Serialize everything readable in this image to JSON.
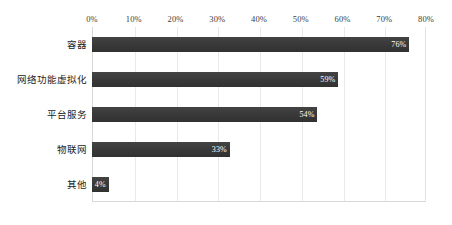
{
  "chart_data": {
    "type": "bar",
    "orientation": "horizontal",
    "title": "",
    "subtitle": "",
    "xlabel": "",
    "ylabel": "",
    "xlim": [
      0,
      80
    ],
    "grid": true,
    "legend": false,
    "legend_position": "none",
    "value_suffix": "%",
    "categories": [
      "容器",
      "网络功能虚拟化",
      "平台服务",
      "物联网",
      "其他"
    ],
    "values": [
      76,
      59,
      54,
      33,
      4
    ],
    "value_labels": [
      "76%",
      "59%",
      "54%",
      "33%",
      "4%"
    ],
    "xticks": [
      0,
      10,
      20,
      30,
      40,
      50,
      60,
      70,
      80
    ],
    "xtick_labels": [
      "0%",
      "10%",
      "20%",
      "30%",
      "40%",
      "50%",
      "60%",
      "70%",
      "80%"
    ],
    "series": [
      {
        "name": "",
        "values": [
          76,
          59,
          54,
          33,
          4
        ]
      }
    ]
  },
  "style": {
    "bar_color": "#3a3a3a",
    "value_text_color": "#ffffff",
    "gridline_color": "#e9e9e9",
    "axis_color": "#d6d6d6",
    "background": "#ffffff",
    "tick_text_color": "#3d3d3d",
    "category_text_color": "#1c1c1c"
  }
}
